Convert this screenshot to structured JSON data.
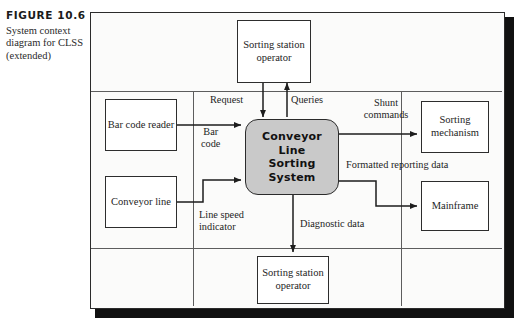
{
  "caption": {
    "figure_label": "FIGURE 10.6",
    "description": "System context diagram for CLSS (extended)"
  },
  "diagram": {
    "process": {
      "name": "Conveyor Line Sorting System",
      "line1": "Conveyor",
      "line2": "Line",
      "line3": "Sorting",
      "line4": "System",
      "fill_color": "#c9c9c9",
      "border_color": "#2b2b2b"
    },
    "terminators": [
      {
        "id": "sorting-station-operator-top",
        "label": "Sorting\nstation\noperator"
      },
      {
        "id": "bar-code-reader",
        "label": "Bar code\nreader"
      },
      {
        "id": "conveyor-line",
        "label": "Conveyor\nline"
      },
      {
        "id": "sorting-mechanism",
        "label": "Sorting\nmechanism"
      },
      {
        "id": "mainframe",
        "label": "Mainframe"
      },
      {
        "id": "sorting-station-operator-bottom",
        "label": "Sorting\nstation\noperator"
      }
    ],
    "flows": [
      {
        "id": "request",
        "label": "Request",
        "from": "sorting-station-operator-top",
        "to": "conveyor-line-sorting-system"
      },
      {
        "id": "queries",
        "label": "Queries",
        "from": "conveyor-line-sorting-system",
        "to": "sorting-station-operator-top"
      },
      {
        "id": "bar-code",
        "label": "Bar\ncode",
        "from": "bar-code-reader",
        "to": "conveyor-line-sorting-system"
      },
      {
        "id": "line-speed-indicator",
        "label": "Line speed\nindicator",
        "from": "conveyor-line",
        "to": "conveyor-line-sorting-system"
      },
      {
        "id": "shunt-commands",
        "label": "Shunt\ncommands",
        "from": "conveyor-line-sorting-system",
        "to": "sorting-mechanism"
      },
      {
        "id": "formatted-reporting-data",
        "label": "Formatted reporting data",
        "from": "conveyor-line-sorting-system",
        "to": "mainframe"
      },
      {
        "id": "diagnostic-data",
        "label": "Diagnostic data",
        "from": "conveyor-line-sorting-system",
        "to": "sorting-station-operator-bottom"
      }
    ],
    "frame": {
      "border_color": "#2b2b2b",
      "background_color": "#fbfbfa",
      "shadow_color": "#111111"
    }
  }
}
